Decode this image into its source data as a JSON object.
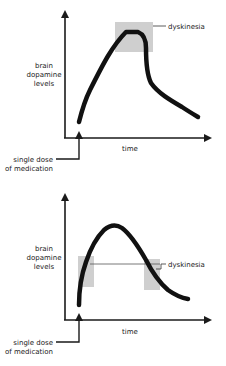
{
  "diagram": {
    "colors": {
      "curve": "#111111",
      "axis": "#1a1a1a",
      "highlight": "#cfcfcf",
      "text": "#222222"
    },
    "panels": [
      {
        "id": "top",
        "y_label_lines": [
          "brain",
          "dopamine",
          "levels"
        ],
        "x_label": "time",
        "dose_label_lines": [
          "single dose",
          "of medication"
        ],
        "dyskinesia_label": "dyskinesia",
        "description": "Dopamine level rises to a high peak plateau (dyskinesia zone at the peak) then drops sharply and decays."
      },
      {
        "id": "bottom",
        "y_label_lines": [
          "brain",
          "dopamine",
          "levels"
        ],
        "x_label": "time",
        "dose_label_lines": [
          "single dose",
          "of medication"
        ],
        "dyskinesia_label": "dyskinesia",
        "description": "Dopamine level rises to a peak then declines gradually; dyskinesia zones occur on the rising and falling slopes."
      }
    ]
  }
}
